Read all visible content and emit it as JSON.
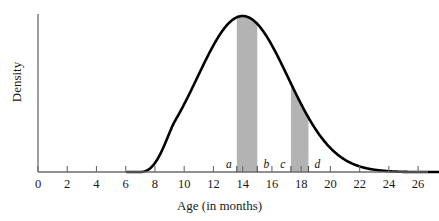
{
  "chart_data": {
    "type": "area",
    "title": "",
    "xlabel": "Age (in months)",
    "ylabel": "Density",
    "xlim": [
      0,
      27.5
    ],
    "ylim": [
      0,
      1.06
    ],
    "grid": false,
    "legend": "none",
    "distribution": {
      "shape": "normal",
      "mean": 14,
      "sd": 3.1,
      "peak_x": 14,
      "left_tail_touch_x": 7,
      "right_tail_touch_x": 26.5
    },
    "x_ticks": [
      0,
      2,
      4,
      6,
      8,
      10,
      12,
      14,
      16,
      18,
      20,
      22,
      24,
      26
    ],
    "x_tick_labels": [
      "0",
      "2",
      "4",
      "6",
      "8",
      "10",
      "12",
      "14",
      "16",
      "18",
      "20",
      "22",
      "24",
      "26"
    ],
    "y_ticks": [],
    "y_tick_labels": [],
    "shaded_regions": [
      {
        "id": "region-ab",
        "start_label": "a",
        "end_label": "b",
        "start_x": 13.6,
        "end_x": 15.0,
        "fill": "#b3b3b3"
      },
      {
        "id": "region-cd",
        "start_label": "c",
        "end_label": "d",
        "start_x": 17.3,
        "end_x": 18.5,
        "fill": "#b3b3b3"
      }
    ],
    "curve_color": "#000000",
    "axis_color": "#6b6b6b"
  },
  "axes": {
    "x_title": "Age (in months)",
    "y_title": "Density"
  },
  "ticks": {
    "x": [
      {
        "value": 0,
        "label": "0"
      },
      {
        "value": 2,
        "label": "2"
      },
      {
        "value": 4,
        "label": "4"
      },
      {
        "value": 6,
        "label": "6"
      },
      {
        "value": 8,
        "label": "8"
      },
      {
        "value": 10,
        "label": "10"
      },
      {
        "value": 12,
        "label": "12"
      },
      {
        "value": 14,
        "label": "14"
      },
      {
        "value": 16,
        "label": "16"
      },
      {
        "value": 18,
        "label": "18"
      },
      {
        "value": 20,
        "label": "20"
      },
      {
        "value": 22,
        "label": "22"
      },
      {
        "value": 24,
        "label": "24"
      },
      {
        "value": 26,
        "label": "26"
      }
    ]
  },
  "band_markers": [
    {
      "name": "a",
      "label": "a",
      "x": 13.6
    },
    {
      "name": "b",
      "label": "b",
      "x": 15.0
    },
    {
      "name": "c",
      "label": "c",
      "x": 17.3
    },
    {
      "name": "d",
      "label": "d",
      "x": 18.5
    }
  ],
  "colors": {
    "band_fill": "#b3b3b3",
    "curve": "#000000",
    "axis": "#6b6b6b",
    "text": "#1a1a1a",
    "background": "#ffffff"
  }
}
